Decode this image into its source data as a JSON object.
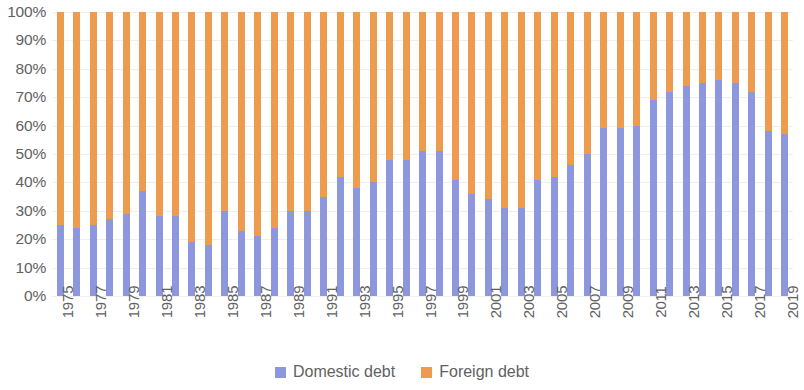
{
  "chart_data": {
    "type": "bar",
    "subtype": "stacked-100-percent",
    "title": "",
    "xlabel": "",
    "ylabel": "",
    "ylim": [
      0,
      100
    ],
    "ytick_labels": [
      "100%",
      "90%",
      "80%",
      "70%",
      "60%",
      "50%",
      "40%",
      "30%",
      "20%",
      "10%",
      "0%"
    ],
    "ytick_values": [
      100,
      90,
      80,
      70,
      60,
      50,
      40,
      30,
      20,
      10,
      0
    ],
    "grid": true,
    "legend_position": "bottom-center",
    "categories": [
      "1975",
      "1976",
      "1977",
      "1978",
      "1979",
      "1980",
      "1981",
      "1982",
      "1983",
      "1984",
      "1985",
      "1986",
      "1987",
      "1988",
      "1989",
      "1990",
      "1991",
      "1992",
      "1993",
      "1994",
      "1995",
      "1996",
      "1997",
      "1998",
      "1999",
      "2000",
      "2001",
      "2002",
      "2003",
      "2004",
      "2005",
      "2006",
      "2007",
      "2008",
      "2009",
      "2010",
      "2011",
      "2012",
      "2013",
      "2014",
      "2015",
      "2016",
      "2017",
      "2018",
      "2019"
    ],
    "visible_xtick_labels": [
      "1975",
      "1977",
      "1979",
      "1981",
      "1983",
      "1985",
      "1987",
      "1989",
      "1991",
      "1993",
      "1995",
      "1997",
      "1999",
      "2001",
      "2003",
      "2005",
      "2007",
      "2009",
      "2011",
      "2013",
      "2015",
      "2017",
      "2019"
    ],
    "series": [
      {
        "name": "Domestic debt",
        "color": "#8C97DE",
        "values": [
          25,
          24,
          25,
          27,
          29,
          37,
          28,
          28,
          19,
          18,
          30,
          23,
          21,
          24,
          30,
          30,
          35,
          42,
          38,
          40,
          48,
          48,
          51,
          51,
          41,
          36,
          34,
          31,
          31,
          41,
          42,
          46,
          50,
          59,
          59,
          60,
          69,
          72,
          74,
          75,
          76,
          75,
          72,
          58,
          57
        ]
      },
      {
        "name": "Foreign debt",
        "color": "#ED9B4F",
        "values": [
          75,
          76,
          75,
          73,
          71,
          63,
          72,
          72,
          81,
          82,
          70,
          77,
          79,
          76,
          70,
          70,
          65,
          58,
          62,
          60,
          52,
          52,
          49,
          49,
          59,
          64,
          66,
          69,
          69,
          59,
          58,
          54,
          50,
          41,
          41,
          40,
          31,
          28,
          26,
          25,
          24,
          25,
          28,
          42,
          43
        ]
      }
    ]
  },
  "legend": {
    "items": [
      {
        "label": "Domestic debt",
        "color": "#8C97DE",
        "icon": "square-swatch-icon"
      },
      {
        "label": "Foreign debt",
        "color": "#ED9B4F",
        "icon": "square-swatch-icon"
      }
    ]
  }
}
